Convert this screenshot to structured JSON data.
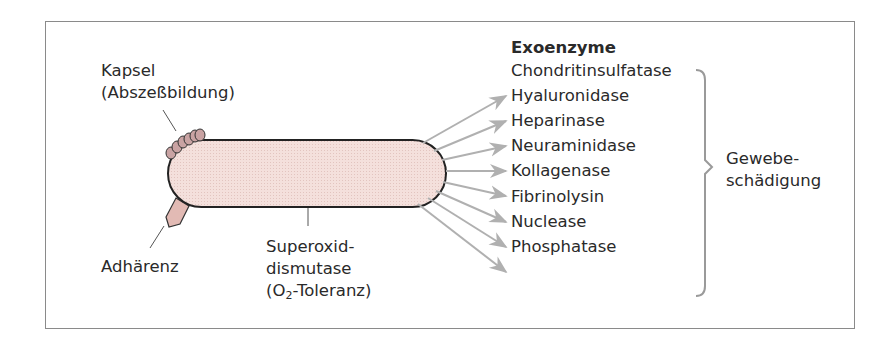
{
  "diagram": {
    "type": "annotated-illustration",
    "colors": {
      "cell_fill": "#f3dcd8",
      "cell_stroke": "#222222",
      "capsule_fill": "#c9a3a3",
      "adhesin_fill": "#e2bab4",
      "arrow": "#b0b0b0",
      "brace": "#9a9a9a",
      "frame": "#8a8a8a"
    },
    "labels": {
      "kapsel_line1": "Kapsel",
      "kapsel_line2": "(Abszeßbildung)",
      "adhaerenz": "Adhärenz",
      "sod_line1": "Superoxid-",
      "sod_line2": "dismutase",
      "sod_line3_pre": "(O",
      "sod_line3_sub": "2",
      "sod_line3_post": "-Toleranz)"
    },
    "exoenzymes": {
      "title": "Exoenzyme",
      "items": [
        "Chondritinsulfatase",
        "Hyaluronidase",
        "Heparinase",
        "Neuraminidase",
        "Kollagenase",
        "Fibrinolysin",
        "Nuclease",
        "Phosphatase"
      ]
    },
    "effect": {
      "line1": "Gewebe-",
      "line2": "schädigung"
    }
  }
}
